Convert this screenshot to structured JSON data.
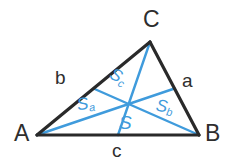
{
  "figure": {
    "type": "geometry-diagram",
    "colors": {
      "triangle_stroke": "#2a2a2a",
      "median_stroke": "#3f9bdc",
      "label_dark": "#2e2e2e",
      "label_blue": "#3f9bdc",
      "background": "#ffffff"
    },
    "canvas": {
      "width": 230,
      "height": 165
    }
  },
  "vertices": [
    {
      "id": "A",
      "label": "A",
      "x": 37,
      "y": 135,
      "label_x": 14,
      "label_y": 122
    },
    {
      "id": "B",
      "label": "B",
      "x": 199,
      "y": 135,
      "label_x": 205,
      "label_y": 122
    },
    {
      "id": "C",
      "label": "C",
      "x": 150,
      "y": 42,
      "label_x": 143,
      "label_y": 8
    }
  ],
  "midpoints": [
    {
      "id": "Ma",
      "of_side": "CB",
      "x": 174.5,
      "y": 88.5
    },
    {
      "id": "Mb",
      "of_side": "AC",
      "x": 93.5,
      "y": 88.5
    },
    {
      "id": "Mc",
      "of_side": "AB",
      "x": 118,
      "y": 135
    }
  ],
  "centroid": {
    "id": "S",
    "x": 128.7,
    "y": 104
  },
  "side_labels": [
    {
      "id": "a",
      "label": "a",
      "side": "CB",
      "x": 182,
      "y": 71
    },
    {
      "id": "b",
      "label": "b",
      "side": "AC",
      "x": 55,
      "y": 68
    },
    {
      "id": "c",
      "label": "c",
      "side": "AB",
      "x": 112,
      "y": 141
    }
  ],
  "area_labels": [
    {
      "id": "Sa",
      "base": "S",
      "sub": "a",
      "x": 77,
      "y": 95,
      "rotation": -8
    },
    {
      "id": "Sb",
      "base": "S",
      "sub": "b",
      "x": 156,
      "y": 98,
      "rotation": 10
    },
    {
      "id": "Sc",
      "base": "S",
      "sub": "c",
      "x": 110,
      "y": 68,
      "rotation": 28
    },
    {
      "id": "S",
      "base": "S",
      "sub": "",
      "x": 119,
      "y": 113,
      "rotation": 0
    }
  ]
}
